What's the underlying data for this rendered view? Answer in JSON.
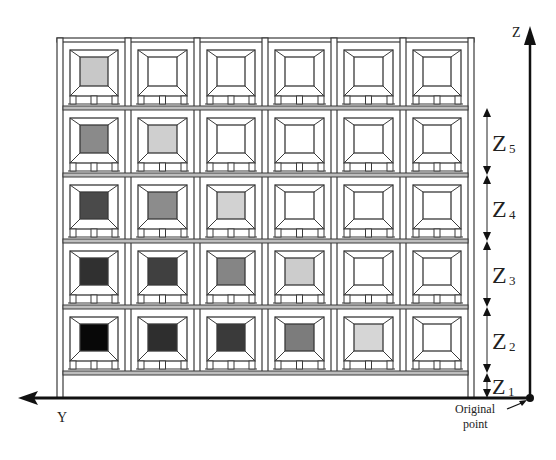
{
  "diagram": {
    "axes": {
      "z_label": "Z",
      "y_label": "Y",
      "origin_label_line1": "Original",
      "origin_label_line2": "point"
    },
    "dimensions": [
      {
        "label": "Z",
        "sub": "5"
      },
      {
        "label": "Z",
        "sub": "4"
      },
      {
        "label": "Z",
        "sub": "3"
      },
      {
        "label": "Z",
        "sub": "2"
      },
      {
        "label": "Z",
        "sub": "1"
      }
    ],
    "rack": {
      "columns": 6,
      "rows": 5,
      "shading_note": "Row index 0 = top; column index 0 = left. Fill colors of each pallet load.",
      "cells": [
        [
          "#c8c8c8",
          "#ffffff",
          "#ffffff",
          "#ffffff",
          "#ffffff",
          "#ffffff"
        ],
        [
          "#8a8a8a",
          "#cfcfcf",
          "#ffffff",
          "#ffffff",
          "#ffffff",
          "#ffffff"
        ],
        [
          "#4a4a4a",
          "#8c8c8c",
          "#d2d2d2",
          "#ffffff",
          "#ffffff",
          "#ffffff"
        ],
        [
          "#303030",
          "#404040",
          "#858585",
          "#cccccc",
          "#ffffff",
          "#ffffff"
        ],
        [
          "#080808",
          "#2e2e2e",
          "#3a3a3a",
          "#7c7c7c",
          "#d6d6d6",
          "#ffffff"
        ]
      ]
    },
    "colors": {
      "line": "#3a3a3a",
      "axis": "#111111",
      "background": "#ffffff"
    }
  }
}
